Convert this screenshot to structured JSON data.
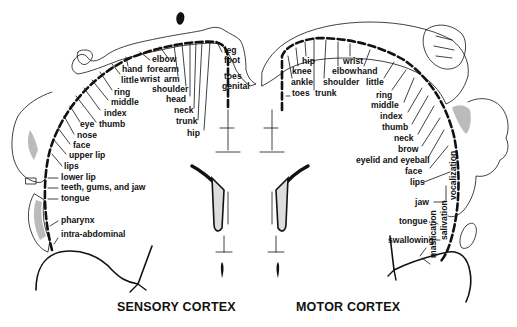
{
  "diagram": {
    "background": "#ffffff",
    "ink_color": "#111111",
    "shading_color": "#bbbbbb"
  },
  "sensory": {
    "title": "SENSORY CORTEX",
    "labels": [
      {
        "text": "leg",
        "x": 224,
        "y": 53
      },
      {
        "text": "foot",
        "x": 224,
        "y": 63
      },
      {
        "text": "toes",
        "x": 224,
        "y": 79
      },
      {
        "text": "genital",
        "x": 222,
        "y": 89
      },
      {
        "text": "elbow",
        "x": 152,
        "y": 62
      },
      {
        "text": "forearm",
        "x": 147,
        "y": 72
      },
      {
        "text": "arm",
        "x": 164,
        "y": 82
      },
      {
        "text": "wrist",
        "x": 140,
        "y": 82
      },
      {
        "text": "shoulder",
        "x": 152,
        "y": 92
      },
      {
        "text": "hand",
        "x": 122,
        "y": 72
      },
      {
        "text": "little",
        "x": 121,
        "y": 83
      },
      {
        "text": "head",
        "x": 166,
        "y": 102
      },
      {
        "text": "neck",
        "x": 174,
        "y": 113
      },
      {
        "text": "trunk",
        "x": 176,
        "y": 124
      },
      {
        "text": "hip",
        "x": 187,
        "y": 136
      },
      {
        "text": "ring",
        "x": 114,
        "y": 95
      },
      {
        "text": "middle",
        "x": 111,
        "y": 105
      },
      {
        "text": "index",
        "x": 104,
        "y": 116
      },
      {
        "text": "thumb",
        "x": 99,
        "y": 127
      },
      {
        "text": "eye",
        "x": 80,
        "y": 127
      },
      {
        "text": "nose",
        "x": 77,
        "y": 138
      },
      {
        "text": "face",
        "x": 73,
        "y": 148
      },
      {
        "text": "upper lip",
        "x": 69,
        "y": 158
      },
      {
        "text": "lips",
        "x": 64,
        "y": 169
      },
      {
        "text": "lower lip",
        "x": 61,
        "y": 180
      },
      {
        "text": "teeth, gums, and jaw",
        "x": 61,
        "y": 190
      },
      {
        "text": "tongue",
        "x": 61,
        "y": 201
      },
      {
        "text": "pharynx",
        "x": 61,
        "y": 223
      },
      {
        "text": "intra-abdominal",
        "x": 61,
        "y": 237
      }
    ]
  },
  "motor": {
    "title": "MOTOR CORTEX",
    "labels": [
      {
        "text": "hip",
        "x": 302,
        "y": 64
      },
      {
        "text": "wrist",
        "x": 343,
        "y": 64
      },
      {
        "text": "knee",
        "x": 292,
        "y": 74
      },
      {
        "text": "elbow",
        "x": 332,
        "y": 74
      },
      {
        "text": "hand",
        "x": 357,
        "y": 74
      },
      {
        "text": "ankle",
        "x": 291,
        "y": 85
      },
      {
        "text": "shoulder",
        "x": 323,
        "y": 85
      },
      {
        "text": "little",
        "x": 366,
        "y": 85
      },
      {
        "text": "toes",
        "x": 292,
        "y": 96
      },
      {
        "text": "trunk",
        "x": 315,
        "y": 96
      },
      {
        "text": "ring",
        "x": 376,
        "y": 98
      },
      {
        "text": "middle",
        "x": 371,
        "y": 108
      },
      {
        "text": "index",
        "x": 380,
        "y": 119
      },
      {
        "text": "thumb",
        "x": 382,
        "y": 130
      },
      {
        "text": "neck",
        "x": 394,
        "y": 141
      },
      {
        "text": "brow",
        "x": 398,
        "y": 152
      },
      {
        "text": "eyelid and eyeball",
        "x": 356,
        "y": 163
      },
      {
        "text": "face",
        "x": 405,
        "y": 174
      },
      {
        "text": "lips",
        "x": 410,
        "y": 185
      },
      {
        "text": "jaw",
        "x": 415,
        "y": 205
      },
      {
        "text": "tongue",
        "x": 399,
        "y": 224
      },
      {
        "text": "swallowing",
        "x": 388,
        "y": 243
      }
    ],
    "vertical_labels": [
      {
        "text": "vocalization",
        "x": 456,
        "y": 200
      },
      {
        "text": "salivation",
        "x": 447,
        "y": 240
      },
      {
        "text": "mastication",
        "x": 436,
        "y": 258
      }
    ]
  }
}
